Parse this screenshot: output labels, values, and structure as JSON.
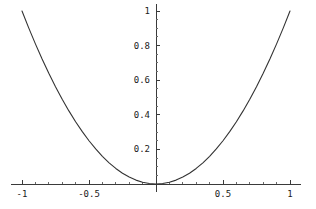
{
  "chart_data": {
    "type": "line",
    "title": "",
    "subtitle": "",
    "xlabel": "",
    "ylabel": "",
    "function": "y = x^2",
    "xlim": [
      -1.08,
      1.08
    ],
    "ylim": [
      -0.045,
      1.04
    ],
    "grid": false,
    "legend": null,
    "legend_position": "none",
    "axes_cross_at": [
      0,
      0
    ],
    "x_major_ticks": [
      -1,
      -0.5,
      0.5,
      1
    ],
    "x_major_tick_labels": [
      "-1",
      "-0.5",
      "0.5",
      "1"
    ],
    "x_minor_ticks": [
      -0.9,
      -0.8,
      -0.7,
      -0.6,
      -0.4,
      -0.3,
      -0.2,
      -0.1,
      0.1,
      0.2,
      0.3,
      0.4,
      0.6,
      0.7,
      0.8,
      0.9
    ],
    "y_major_ticks": [
      0.2,
      0.4,
      0.6,
      0.8,
      1
    ],
    "y_major_tick_labels": [
      "0.2",
      "0.4",
      "0.6",
      "0.8",
      "1"
    ],
    "y_minor_ticks": [
      0.05,
      0.1,
      0.15,
      0.25,
      0.3,
      0.35,
      0.45,
      0.5,
      0.55,
      0.65,
      0.7,
      0.75,
      0.85,
      0.9,
      0.95
    ],
    "series": [
      {
        "name": "x^2",
        "color": "#333333",
        "x": [
          -1,
          -0.95,
          -0.9,
          -0.85,
          -0.8,
          -0.75,
          -0.7,
          -0.65,
          -0.6,
          -0.55,
          -0.5,
          -0.45,
          -0.4,
          -0.35,
          -0.3,
          -0.25,
          -0.2,
          -0.15,
          -0.1,
          -0.05,
          0,
          0.05,
          0.1,
          0.15,
          0.2,
          0.25,
          0.3,
          0.35,
          0.4,
          0.45,
          0.5,
          0.55,
          0.6,
          0.65,
          0.7,
          0.75,
          0.8,
          0.85,
          0.9,
          0.95,
          1
        ],
        "y": [
          1,
          0.9025,
          0.81,
          0.7225,
          0.64,
          0.5625,
          0.49,
          0.4225,
          0.36,
          0.3025,
          0.25,
          0.2025,
          0.16,
          0.1225,
          0.09,
          0.0625,
          0.04,
          0.0225,
          0.01,
          0.0025,
          0,
          0.0025,
          0.01,
          0.0225,
          0.04,
          0.0625,
          0.09,
          0.1225,
          0.16,
          0.2025,
          0.25,
          0.3025,
          0.36,
          0.4225,
          0.49,
          0.5625,
          0.64,
          0.7225,
          0.81,
          0.9025,
          1
        ]
      }
    ]
  },
  "style": {
    "background": "#ffffff",
    "axis_color": "#3a3a3a",
    "curve_color": "#333333",
    "label_color": "#1a1a1a"
  }
}
